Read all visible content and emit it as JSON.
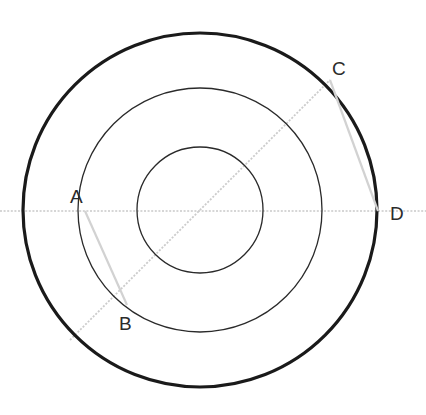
{
  "figure": {
    "canvas": {
      "width": 426,
      "height": 415,
      "background": "#ffffff"
    },
    "center": {
      "x": 200,
      "y": 210
    },
    "circles": [
      {
        "name": "outer-circle",
        "radius": 177,
        "stroke": "#1a1a1a",
        "stroke_width": 3.2
      },
      {
        "name": "middle-circle",
        "radius": 122,
        "stroke": "#2a2a2a",
        "stroke_width": 1.3
      },
      {
        "name": "inner-circle",
        "radius": 63,
        "stroke": "#2a2a2a",
        "stroke_width": 1.3
      }
    ],
    "lines": [
      {
        "name": "horizontal-diameter",
        "x1": 0,
        "y1": 211,
        "x2": 426,
        "y2": 211,
        "stroke": "#c9c9c9",
        "stroke_width": 1.6,
        "dash": "2 1.6"
      },
      {
        "name": "diagonal-secant",
        "x1": 70,
        "y1": 340,
        "x2": 330,
        "y2": 80,
        "stroke": "#cccccc",
        "stroke_width": 1.8,
        "dash": "2 1.6"
      },
      {
        "name": "chord-ab",
        "x1": 85,
        "y1": 211,
        "x2": 127,
        "y2": 305,
        "stroke": "#d2d2d2",
        "stroke_width": 2.2,
        "dash": "0"
      },
      {
        "name": "chord-cd",
        "x1": 330,
        "y1": 80,
        "x2": 378,
        "y2": 211,
        "stroke": "#d2d2d2",
        "stroke_width": 2.2,
        "dash": "0"
      }
    ],
    "points": [
      {
        "id": "A",
        "label": "A",
        "x": 85,
        "y": 211,
        "label_x": 70,
        "label_y": 203
      },
      {
        "id": "B",
        "label": "B",
        "x": 127,
        "y": 305,
        "label_x": 119,
        "label_y": 330
      },
      {
        "id": "C",
        "label": "C",
        "x": 330,
        "y": 80,
        "label_x": 332,
        "label_y": 75
      },
      {
        "id": "D",
        "label": "D",
        "x": 378,
        "y": 211,
        "label_x": 390,
        "label_y": 220
      }
    ]
  }
}
